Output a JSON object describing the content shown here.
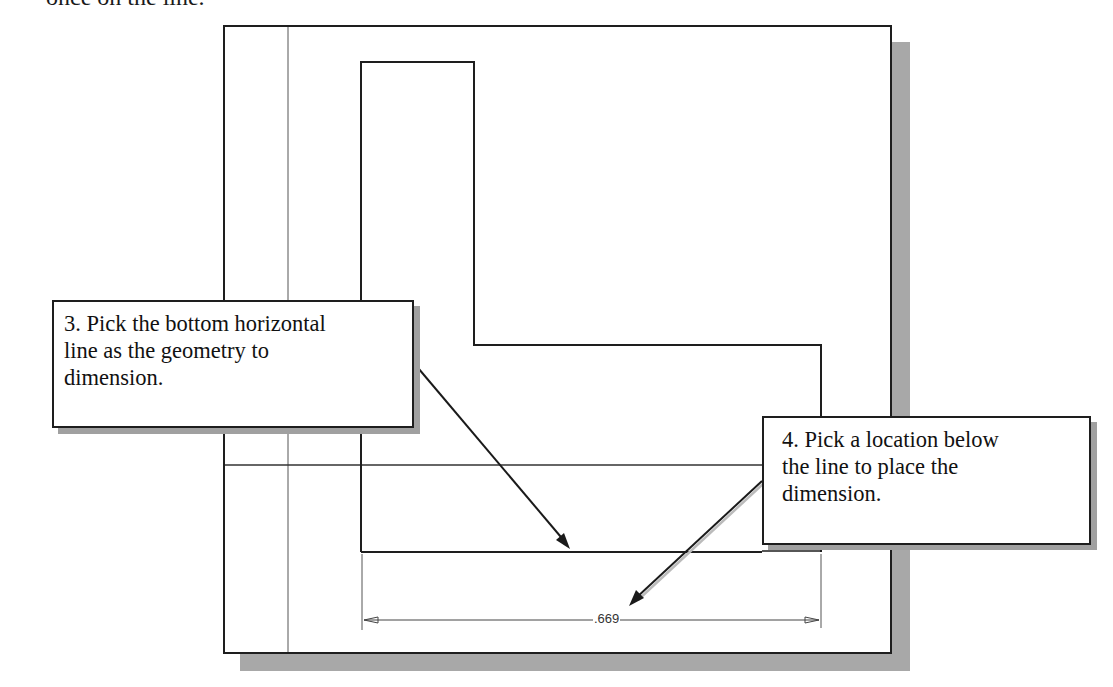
{
  "header_text": "once on the line.",
  "drawing": {
    "dimension_value": ".669"
  },
  "callouts": [
    {
      "step": "3",
      "lines": [
        "3. Pick the bottom horizontal",
        "line as the geometry to",
        "dimension."
      ]
    },
    {
      "step": "4",
      "lines": [
        "4. Pick a location below",
        "the line to place the",
        "dimension."
      ]
    }
  ],
  "colors": {
    "line": "#1e1e1e",
    "guide": "#555555",
    "shadow": "#a8a8a8"
  }
}
